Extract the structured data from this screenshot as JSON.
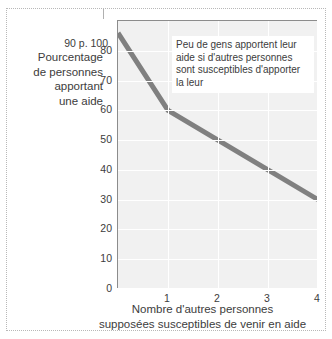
{
  "chart_data": {
    "type": "line",
    "title": "",
    "xlabel_lines": [
      "Nombre d'autres personnes",
      "supposées susceptibles de venir en aide"
    ],
    "ylabel_lines": [
      "Pourcentage",
      "de personnes",
      "apportant",
      "une aide"
    ],
    "x": [
      0,
      1,
      2,
      3,
      4
    ],
    "values": [
      86,
      60,
      50,
      40,
      30
    ],
    "series": [
      {
        "name": "Pourcentage de personnes apportant une aide",
        "values": [
          86,
          60,
          50,
          40,
          30
        ]
      }
    ],
    "xlim": [
      0,
      4
    ],
    "ylim": [
      0,
      90
    ],
    "x_ticks": [
      "1",
      "2",
      "3",
      "4"
    ],
    "y_ticks": [
      "0",
      "10",
      "20",
      "30",
      "40",
      "50",
      "60",
      "70",
      "80"
    ],
    "y_top_tick_label": "90 p. 100",
    "grid": true,
    "legend": "none",
    "annotation": "Peu de gens apportent leur aide si d'autres personnes sont susceptibles d'apporter la leur",
    "colors": {
      "line": "#808080",
      "plot_background": "#f1f1f1",
      "gridline": "#ffffff",
      "axis": "#8c8c8c",
      "text": "#3c3c3c",
      "frame": "#b8b8b8"
    }
  }
}
